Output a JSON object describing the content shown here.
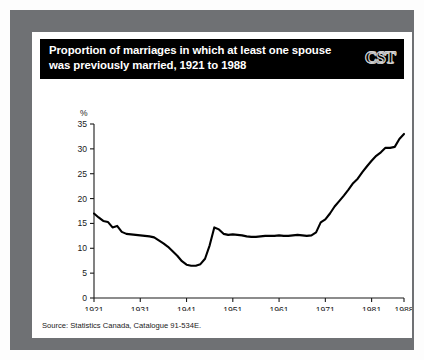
{
  "card": {
    "title": "Proportion of marriages in which at least one spouse\nwas previously married, 1921 to 1988",
    "logo": "CST",
    "source": "Source: Statistics Canada, Catalogue 91-534E."
  },
  "chart_data": {
    "type": "line",
    "title": "Proportion of marriages in which at least one spouse was previously married, 1921 to 1988",
    "xlabel": "Year of marriage",
    "ylabel": "%",
    "yunit": "%",
    "xlim": [
      1921,
      1988
    ],
    "ylim": [
      0,
      35
    ],
    "ytick_step": 5,
    "yticks": [
      0,
      5,
      10,
      15,
      20,
      25,
      30,
      35
    ],
    "xticks": [
      1921,
      1931,
      1941,
      1951,
      1961,
      1971,
      1981,
      1988
    ],
    "grid": false,
    "legend": false,
    "line_color": "#000000",
    "series": [
      {
        "name": "At least one spouse previously married",
        "x": [
          1921,
          1922,
          1923,
          1924,
          1925,
          1926,
          1927,
          1928,
          1929,
          1930,
          1931,
          1932,
          1933,
          1934,
          1935,
          1936,
          1937,
          1938,
          1939,
          1940,
          1941,
          1942,
          1943,
          1944,
          1945,
          1946,
          1947,
          1948,
          1949,
          1950,
          1951,
          1952,
          1953,
          1954,
          1955,
          1956,
          1957,
          1958,
          1959,
          1960,
          1961,
          1962,
          1963,
          1964,
          1965,
          1966,
          1967,
          1968,
          1969,
          1970,
          1971,
          1972,
          1973,
          1974,
          1975,
          1976,
          1977,
          1978,
          1979,
          1980,
          1981,
          1982,
          1983,
          1984,
          1985,
          1986,
          1987,
          1988
        ],
        "values": [
          17.0,
          16.2,
          15.5,
          15.3,
          14.2,
          14.5,
          13.3,
          12.9,
          12.8,
          12.7,
          12.6,
          12.5,
          12.4,
          12.2,
          11.6,
          11.0,
          10.3,
          9.4,
          8.5,
          7.4,
          6.7,
          6.5,
          6.5,
          6.8,
          7.9,
          10.6,
          14.2,
          13.8,
          12.9,
          12.7,
          12.8,
          12.7,
          12.6,
          12.4,
          12.3,
          12.3,
          12.4,
          12.5,
          12.5,
          12.5,
          12.6,
          12.5,
          12.5,
          12.6,
          12.7,
          12.6,
          12.5,
          12.6,
          13.2,
          15.2,
          15.8,
          17.0,
          18.4,
          19.5,
          20.6,
          21.8,
          23.1,
          24.0,
          25.3,
          26.5,
          27.6,
          28.6,
          29.3,
          30.2,
          30.2,
          30.4,
          32.0,
          33.0
        ]
      }
    ]
  }
}
